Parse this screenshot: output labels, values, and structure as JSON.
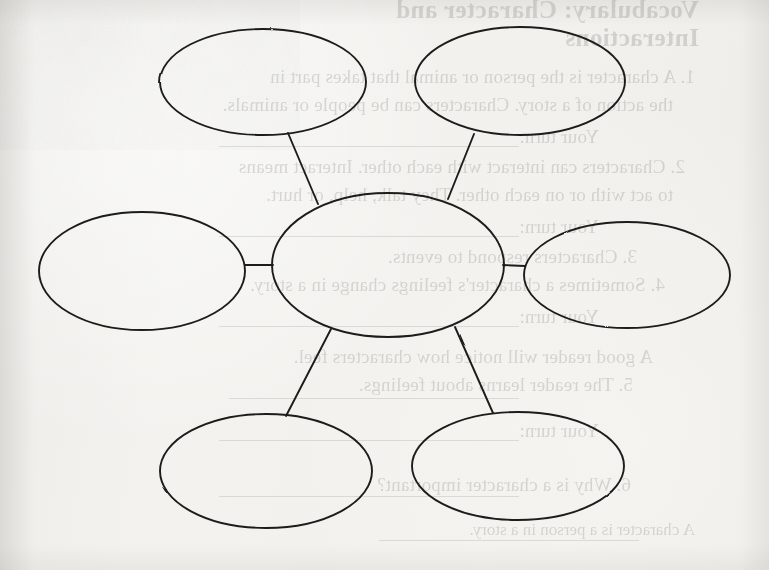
{
  "page": {
    "kind": "scanned-worksheet",
    "width": 769,
    "height": 570,
    "paper_color": "#f1f0ed",
    "ink_color": "#1d1c1a",
    "bleed_color": "#3c3a36"
  },
  "diagram": {
    "type": "concept-map",
    "title": "",
    "center": {
      "id": "center",
      "label": "",
      "cx": 388,
      "cy": 265,
      "rx": 116,
      "ry": 72
    },
    "nodes": [
      {
        "id": "top-left",
        "label": "",
        "cx": 263,
        "cy": 82,
        "rx": 103,
        "ry": 53
      },
      {
        "id": "top-right",
        "label": "",
        "cx": 520,
        "cy": 81,
        "rx": 105,
        "ry": 54
      },
      {
        "id": "left",
        "label": "",
        "cx": 142,
        "cy": 271,
        "rx": 103,
        "ry": 59
      },
      {
        "id": "right",
        "label": "",
        "cx": 627,
        "cy": 275,
        "rx": 103,
        "ry": 53
      },
      {
        "id": "bottom-left",
        "label": "",
        "cx": 266,
        "cy": 471,
        "rx": 106,
        "ry": 57
      },
      {
        "id": "bottom-right",
        "label": "",
        "cx": 518,
        "cy": 466,
        "rx": 106,
        "ry": 54
      }
    ],
    "connectors": [
      {
        "from": "top-left",
        "to": "center",
        "x1": 288,
        "y1": 133,
        "x2": 318,
        "y2": 204
      },
      {
        "from": "top-right",
        "to": "center",
        "x1": 474,
        "y1": 134,
        "x2": 448,
        "y2": 199
      },
      {
        "from": "left",
        "to": "center",
        "x1": 245,
        "y1": 265,
        "x2": 273,
        "y2": 265
      },
      {
        "from": "right",
        "to": "center",
        "x1": 503,
        "y1": 265,
        "x2": 525,
        "y2": 266
      },
      {
        "from": "bottom-left",
        "to": "center",
        "x1": 331,
        "y1": 329,
        "x2": 286,
        "y2": 416
      },
      {
        "from": "bottom-right",
        "to": "center",
        "x1": 455,
        "y1": 327,
        "x2": 493,
        "y2": 413
      }
    ]
  },
  "bleed_through": {
    "note": "Faint mirrored show-through text from the reverse side of the sheet.",
    "lines": [
      {
        "text": "Vocabulary: Character and",
        "style": "hd",
        "x": 70,
        "y": -4,
        "size": 25
      },
      {
        "text": "Interactions",
        "style": "hd",
        "x": 70,
        "y": 24,
        "size": 25
      },
      {
        "text": "1. A character is the person or animal that takes part in",
        "style": "bd",
        "x": 74,
        "y": 66,
        "size": 19
      },
      {
        "text": "the action of a story. Characters can be people or animals.",
        "style": "bd",
        "x": 96,
        "y": 94,
        "size": 19
      },
      {
        "text": "Your turn:",
        "style": "bd",
        "x": 170,
        "y": 126,
        "size": 19
      },
      {
        "text": "2. Characters can interact with each other. Interact means",
        "style": "bd",
        "x": 84,
        "y": 156,
        "size": 19
      },
      {
        "text": "to act with or on each other. They talk, help, or hurt.",
        "style": "bd",
        "x": 96,
        "y": 184,
        "size": 19
      },
      {
        "text": "Your turn:",
        "style": "bd",
        "x": 170,
        "y": 216,
        "size": 19
      },
      {
        "text": "3. Characters respond to events.",
        "style": "bd",
        "x": 132,
        "y": 246,
        "size": 19
      },
      {
        "text": "4. Sometimes a character's feelings change in a story.",
        "style": "bd",
        "x": 104,
        "y": 274,
        "size": 19
      },
      {
        "text": "Your turn:",
        "style": "bd",
        "x": 170,
        "y": 306,
        "size": 19
      },
      {
        "text": "A good reader will notice how characters feel.",
        "style": "bd",
        "x": 116,
        "y": 346,
        "size": 19
      },
      {
        "text": "5. The reader learns about feelings.",
        "style": "bd",
        "x": 136,
        "y": 374,
        "size": 19
      },
      {
        "text": "Your turn:",
        "style": "bd",
        "x": 170,
        "y": 420,
        "size": 19
      },
      {
        "text": "6. Why is a character important?",
        "style": "bd",
        "x": 138,
        "y": 474,
        "size": 19
      },
      {
        "text": "A character is a person in a story.",
        "style": "sm",
        "x": 74,
        "y": 520,
        "size": 17
      }
    ],
    "rules": [
      {
        "x": 250,
        "y": 146,
        "w": 300
      },
      {
        "x": 250,
        "y": 236,
        "w": 300
      },
      {
        "x": 250,
        "y": 326,
        "w": 300
      },
      {
        "x": 250,
        "y": 398,
        "w": 290
      },
      {
        "x": 250,
        "y": 440,
        "w": 300
      },
      {
        "x": 250,
        "y": 496,
        "w": 300
      },
      {
        "x": 130,
        "y": 540,
        "w": 260
      }
    ]
  }
}
